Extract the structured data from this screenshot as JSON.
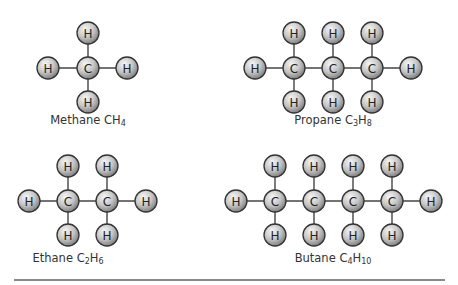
{
  "diagram": {
    "atom_style": {
      "radius": 11,
      "fill_light": "#f2f2f2",
      "fill_dark": "#8c8c8c",
      "stroke": "#333333",
      "bond_color": "#444444"
    },
    "molecules": [
      {
        "name": "Methane",
        "formula": {
          "parts": [
            {
              "t": "C"
            },
            {
              "sub": ""
            },
            {
              "t": "H"
            },
            {
              "sub": "4"
            }
          ]
        },
        "caption": {
          "name": "Methane ",
          "f1": "CH",
          "s1": "4",
          "f2": "",
          "s2": "",
          "x": 88,
          "y": 113
        },
        "atoms": [
          {
            "el": "C",
            "x": 88,
            "y": 68
          },
          {
            "el": "H",
            "x": 88,
            "y": 33
          },
          {
            "el": "H",
            "x": 88,
            "y": 102
          },
          {
            "el": "H",
            "x": 48,
            "y": 68
          },
          {
            "el": "H",
            "x": 127,
            "y": 68
          }
        ],
        "bonds": [
          [
            0,
            1
          ],
          [
            0,
            2
          ],
          [
            0,
            3
          ],
          [
            0,
            4
          ]
        ]
      },
      {
        "name": "Propane",
        "caption": {
          "name": "Propane ",
          "f1": "C",
          "s1": "3",
          "f2": "H",
          "s2": "8",
          "x": 333,
          "y": 113
        },
        "atoms": [
          {
            "el": "H",
            "x": 255,
            "y": 68
          },
          {
            "el": "C",
            "x": 294,
            "y": 68
          },
          {
            "el": "C",
            "x": 333,
            "y": 68
          },
          {
            "el": "C",
            "x": 372,
            "y": 68
          },
          {
            "el": "H",
            "x": 411,
            "y": 68
          },
          {
            "el": "H",
            "x": 294,
            "y": 33
          },
          {
            "el": "H",
            "x": 333,
            "y": 33
          },
          {
            "el": "H",
            "x": 372,
            "y": 33
          },
          {
            "el": "H",
            "x": 294,
            "y": 102
          },
          {
            "el": "H",
            "x": 333,
            "y": 102
          },
          {
            "el": "H",
            "x": 372,
            "y": 102
          }
        ],
        "bonds": [
          [
            0,
            1
          ],
          [
            1,
            2
          ],
          [
            2,
            3
          ],
          [
            3,
            4
          ],
          [
            1,
            5
          ],
          [
            2,
            6
          ],
          [
            3,
            7
          ],
          [
            1,
            8
          ],
          [
            2,
            9
          ],
          [
            3,
            10
          ]
        ]
      },
      {
        "name": "Ethane",
        "caption": {
          "name": "Ethane ",
          "f1": "C",
          "s1": "2",
          "f2": "H",
          "s2": "6",
          "x": 68,
          "y": 251
        },
        "atoms": [
          {
            "el": "H",
            "x": 29,
            "y": 201
          },
          {
            "el": "C",
            "x": 68,
            "y": 201
          },
          {
            "el": "C",
            "x": 107,
            "y": 201
          },
          {
            "el": "H",
            "x": 146,
            "y": 201
          },
          {
            "el": "H",
            "x": 68,
            "y": 166
          },
          {
            "el": "H",
            "x": 107,
            "y": 166
          },
          {
            "el": "H",
            "x": 68,
            "y": 235
          },
          {
            "el": "H",
            "x": 107,
            "y": 235
          }
        ],
        "bonds": [
          [
            0,
            1
          ],
          [
            1,
            2
          ],
          [
            2,
            3
          ],
          [
            1,
            4
          ],
          [
            2,
            5
          ],
          [
            1,
            6
          ],
          [
            2,
            7
          ]
        ]
      },
      {
        "name": "Butane",
        "caption": {
          "name": "Butane ",
          "f1": "C",
          "s1": "4",
          "f2": "H",
          "s2": "10",
          "x": 333,
          "y": 251
        },
        "atoms": [
          {
            "el": "H",
            "x": 236,
            "y": 201
          },
          {
            "el": "C",
            "x": 275,
            "y": 201
          },
          {
            "el": "C",
            "x": 314,
            "y": 201
          },
          {
            "el": "C",
            "x": 353,
            "y": 201
          },
          {
            "el": "C",
            "x": 392,
            "y": 201
          },
          {
            "el": "H",
            "x": 431,
            "y": 201
          },
          {
            "el": "H",
            "x": 275,
            "y": 166
          },
          {
            "el": "H",
            "x": 314,
            "y": 166
          },
          {
            "el": "H",
            "x": 353,
            "y": 166
          },
          {
            "el": "H",
            "x": 392,
            "y": 166
          },
          {
            "el": "H",
            "x": 275,
            "y": 235
          },
          {
            "el": "H",
            "x": 314,
            "y": 235
          },
          {
            "el": "H",
            "x": 353,
            "y": 235
          },
          {
            "el": "H",
            "x": 392,
            "y": 235
          }
        ],
        "bonds": [
          [
            0,
            1
          ],
          [
            1,
            2
          ],
          [
            2,
            3
          ],
          [
            3,
            4
          ],
          [
            4,
            5
          ],
          [
            1,
            6
          ],
          [
            2,
            7
          ],
          [
            3,
            8
          ],
          [
            4,
            9
          ],
          [
            1,
            10
          ],
          [
            2,
            11
          ],
          [
            3,
            12
          ],
          [
            4,
            13
          ]
        ]
      }
    ]
  }
}
